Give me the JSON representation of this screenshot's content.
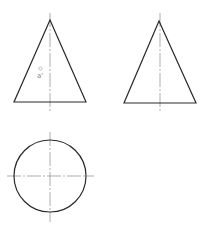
{
  "drawing": {
    "type": "orthographic projection of a cone",
    "views": [
      {
        "name": "front-view",
        "shape": "triangle",
        "apex": [
          50,
          20
        ],
        "base_left": [
          14,
          102
        ],
        "base_right": [
          86,
          102
        ],
        "centerline_x": 50
      },
      {
        "name": "side-view",
        "shape": "triangle",
        "apex": [
          159,
          21
        ],
        "base_left": [
          124,
          103
        ],
        "base_right": [
          196,
          103
        ],
        "centerline_x": 160
      },
      {
        "name": "top-view",
        "shape": "circle",
        "center": [
          50,
          176
        ],
        "radius": 36
      }
    ],
    "point_label": "a'",
    "colors": {
      "outline": "#2a2a2a",
      "centerline": "#8a8a8a",
      "label": "#888888",
      "background": "#ffffff"
    }
  }
}
